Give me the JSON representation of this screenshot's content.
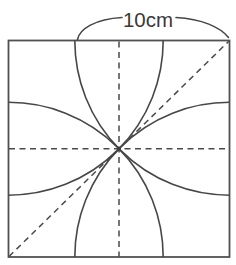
{
  "figure": {
    "side_label": "10cm",
    "shape": "square-with-corner-arcs",
    "colors": {
      "line": "#474747",
      "border": "#515151",
      "dashed": "#4a4a4a",
      "label_text": "#3a3a3a",
      "background": "#ffffff"
    }
  }
}
